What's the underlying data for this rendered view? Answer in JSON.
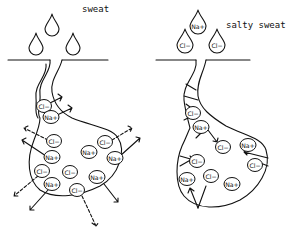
{
  "left_panel": {
    "label": "sweat",
    "drops": [
      {
        "x": 52,
        "y": 28,
        "ion": ""
      },
      {
        "x": 36,
        "y": 47,
        "ion": ""
      },
      {
        "x": 73,
        "y": 47,
        "ion": ""
      }
    ],
    "ions": [
      {
        "x": 44,
        "y": 106,
        "ion": "Cl−"
      },
      {
        "x": 51,
        "y": 117,
        "ion": "Na+"
      },
      {
        "x": 54,
        "y": 141,
        "ion": "Cl−"
      },
      {
        "x": 52,
        "y": 157,
        "ion": "Na+"
      },
      {
        "x": 89,
        "y": 152,
        "ion": "Na+"
      },
      {
        "x": 105,
        "y": 142,
        "ion": "Cl−"
      },
      {
        "x": 115,
        "y": 158,
        "ion": "Na+"
      },
      {
        "x": 42,
        "y": 171,
        "ion": "Cl−"
      },
      {
        "x": 52,
        "y": 184,
        "ion": "Na+"
      },
      {
        "x": 70,
        "y": 172,
        "ion": "Cl−"
      },
      {
        "x": 77,
        "y": 190,
        "ion": "Cl−"
      },
      {
        "x": 97,
        "y": 177,
        "ion": "Na+"
      }
    ]
  },
  "right_panel": {
    "label": "salty sweat",
    "drops": [
      {
        "x": 198,
        "y": 25,
        "ion": "Na+"
      },
      {
        "x": 185,
        "y": 44,
        "ion": "Cl−"
      },
      {
        "x": 217,
        "y": 44,
        "ion": "Cl−"
      }
    ],
    "ions": [
      {
        "x": 193,
        "y": 113,
        "ion": "Cl−"
      },
      {
        "x": 201,
        "y": 127,
        "ion": "Na+"
      },
      {
        "x": 223,
        "y": 147,
        "ion": "Cl−"
      },
      {
        "x": 248,
        "y": 145,
        "ion": "Na+"
      },
      {
        "x": 197,
        "y": 161,
        "ion": "Cl−"
      },
      {
        "x": 255,
        "y": 165,
        "ion": "Cl−"
      },
      {
        "x": 187,
        "y": 179,
        "ion": "Na+"
      },
      {
        "x": 211,
        "y": 176,
        "ion": "Cl−"
      },
      {
        "x": 232,
        "y": 184,
        "ion": "Na+"
      }
    ]
  }
}
